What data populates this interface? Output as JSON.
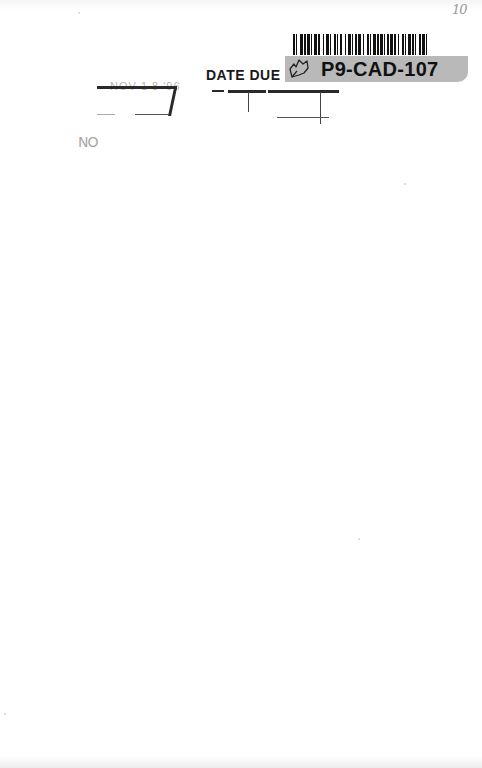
{
  "page": {
    "type": "scanned book endpaper",
    "background_color": "#ffffff"
  },
  "corner_mark": {
    "text": "10"
  },
  "barcode_label": {
    "code": "P9-CAD-107",
    "icon": "leaf-outline-icon",
    "band_color": "#b9b9b9",
    "text_color": "#111111"
  },
  "date_due_slip": {
    "heading": "DATE DUE",
    "stamped_date": "NOV 1 8 '96"
  },
  "margin_mark": {
    "text": "NO"
  }
}
